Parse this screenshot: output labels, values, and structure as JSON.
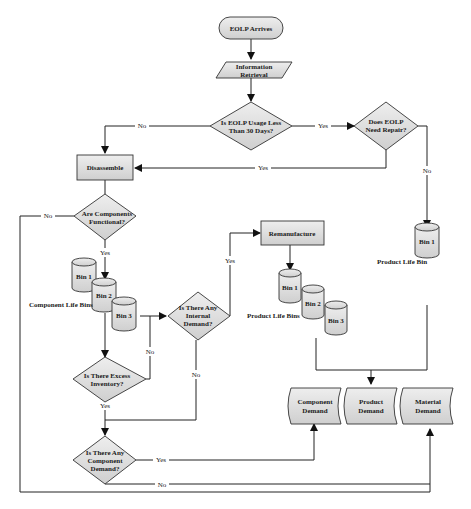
{
  "diagram": {
    "nodes": {
      "start": "EOLP Arrives",
      "info_retrieval": [
        "Information",
        "Retrieval"
      ],
      "usage_check": [
        "Is EOLP Usage Less",
        "Than 30 Days?"
      ],
      "repair_check": [
        "Does EOLP",
        "Need Repair?"
      ],
      "disassemble": "Disassemble",
      "components_functional": [
        "Are Components",
        "Functional?"
      ],
      "remanufacture": "Remanufacture",
      "internal_demand": [
        "Is There Any",
        "Internal",
        "Demand?"
      ],
      "excess_inventory": [
        "Is There Excess",
        "Inventory?"
      ],
      "component_demand_check": [
        "Is There Any",
        "Component",
        "Demand?"
      ],
      "component_demand": [
        "Component",
        "Demand"
      ],
      "product_demand": [
        "Product",
        "Demand"
      ],
      "material_demand": [
        "Material",
        "Demand"
      ]
    },
    "bins": {
      "component_life": {
        "label": "Component Life Bins",
        "items": [
          "Bin 1",
          "Bin 2",
          "Bin 3"
        ]
      },
      "product_life": {
        "label": "Product Life Bins",
        "items": [
          "Bin 1",
          "Bin 2",
          "Bin 3"
        ]
      },
      "product_life_single": {
        "label": "Product Life Bin",
        "items": [
          "Bin 1"
        ]
      }
    },
    "edge_labels": {
      "usage_no": "No",
      "usage_yes": "Yes",
      "repair_yes": "Yes",
      "repair_no": "No",
      "functional_no": "No",
      "functional_yes": "Yes",
      "internal_yes": "Yes",
      "internal_no": "No",
      "excess_no": "No",
      "excess_yes": "Yes",
      "compdemand_yes": "Yes",
      "compdemand_no": "No"
    }
  }
}
